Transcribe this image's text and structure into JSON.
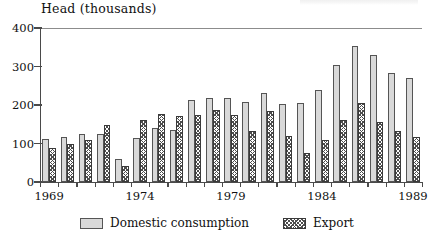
{
  "chart_data": {
    "type": "bar",
    "title": "",
    "subtitle": "",
    "xlabel": "",
    "ylabel": "Head (thousands)",
    "ylim": [
      0,
      400
    ],
    "yticks": [
      0,
      100,
      200,
      300,
      400
    ],
    "ytick_labels": [
      "0",
      "100",
      "200",
      "300",
      "400"
    ],
    "grid": false,
    "legend_position": "bottom-center",
    "categories": [
      "1969",
      "1970",
      "1971",
      "1972",
      "1973",
      "1974",
      "1975",
      "1976",
      "1977",
      "1978",
      "1979",
      "1980",
      "1981",
      "1982",
      "1983",
      "1984",
      "1985",
      "1986",
      "1987",
      "1988",
      "1989"
    ],
    "xtick_labels": [
      "1969",
      "1974",
      "1979",
      "1984",
      "1989"
    ],
    "xtick_label_positions": [
      0,
      5,
      10,
      15,
      20
    ],
    "series": [
      {
        "name": "Domestic consumption",
        "fill": "light-dotted",
        "color": "#d9d9d9",
        "values": [
          112,
          118,
          124,
          125,
          60,
          114,
          140,
          136,
          212,
          219,
          217,
          207,
          230,
          203,
          204,
          238,
          303,
          353,
          329,
          283,
          270
        ]
      },
      {
        "name": "Export",
        "fill": "dark-crosshatch",
        "color": "#4d4d4d",
        "values": [
          89,
          99,
          109,
          147,
          41,
          161,
          176,
          172,
          174,
          188,
          175,
          133,
          185,
          119,
          76,
          109,
          160,
          205,
          155,
          132,
          117
        ]
      }
    ]
  },
  "legend": {
    "items": [
      {
        "label": "Domestic consumption",
        "swatch": "light-dotted-swatch"
      },
      {
        "label": "Export",
        "swatch": "dark-crosshatch-swatch"
      }
    ]
  }
}
